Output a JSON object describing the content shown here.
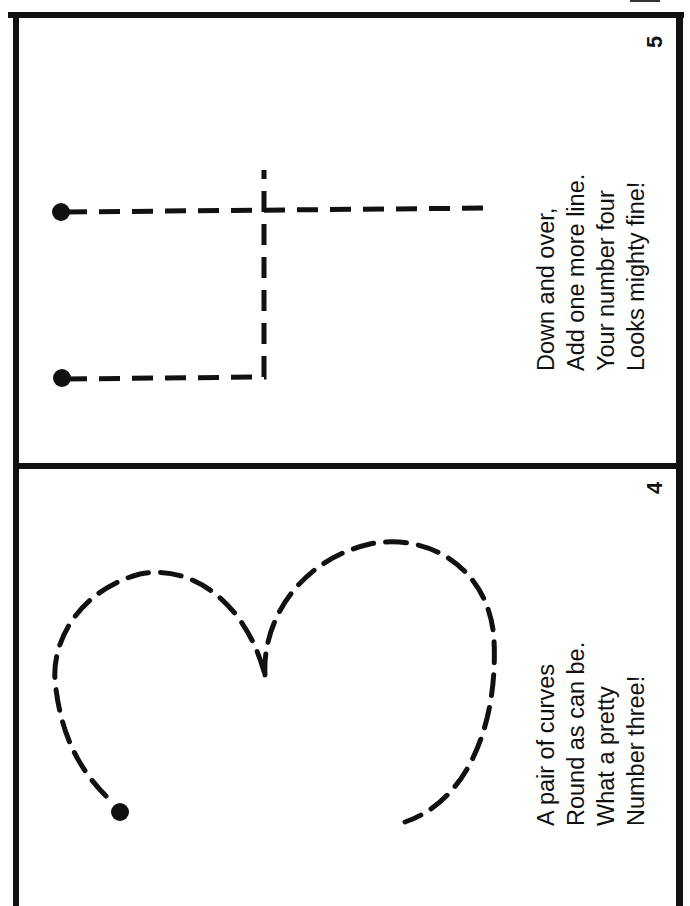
{
  "document": {
    "type": "number tracing booklet pages (rotated 90°)",
    "colors": {
      "ink": "#111111",
      "paper": "#ffffff"
    }
  },
  "pages": [
    {
      "page_number": "5",
      "numeral_traced": "4",
      "verse": [
        "Down and over,",
        "Add one more line.",
        "Your number four",
        "Looks mighty fine!"
      ],
      "start_dots": 2
    },
    {
      "page_number": "4",
      "numeral_traced": "3",
      "verse": [
        "A pair of curves",
        "Round as can be.",
        "What a pretty",
        "Number three!"
      ],
      "start_dots": 1
    }
  ]
}
